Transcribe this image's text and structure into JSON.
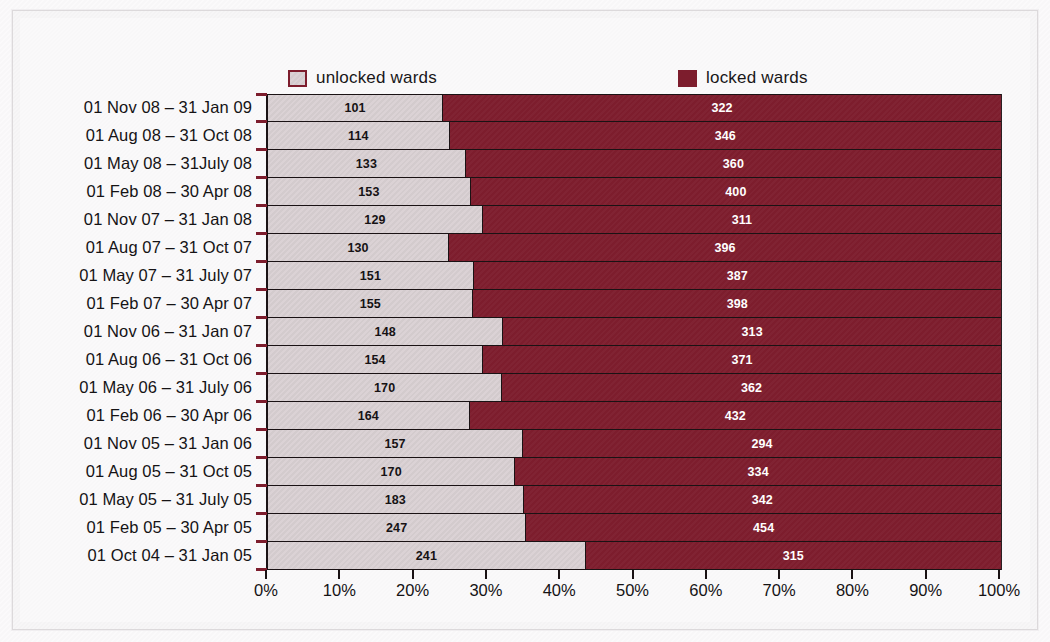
{
  "chart_data": {
    "type": "bar",
    "subtype": "horizontal-stacked-100-percent",
    "title": "",
    "xlabel": "",
    "ylabel": "",
    "xlim": [
      0,
      100
    ],
    "x_tick_labels": [
      "0%",
      "10%",
      "20%",
      "30%",
      "40%",
      "50%",
      "60%",
      "70%",
      "80%",
      "90%",
      "100%"
    ],
    "x_tick_values": [
      0,
      10,
      20,
      30,
      40,
      50,
      60,
      70,
      80,
      90,
      100
    ],
    "grid": false,
    "legend_position": "top",
    "colors": {
      "unlocked": "#dbd2d5",
      "locked": "#7d1d2d",
      "outline": "#1a1214",
      "text": "#151315",
      "background": "#faf9fa"
    },
    "series": [
      {
        "name": "unlocked wards",
        "color": "#dbd2d5",
        "values": [
          101,
          114,
          133,
          153,
          129,
          130,
          151,
          155,
          148,
          154,
          170,
          164,
          157,
          170,
          183,
          247,
          241
        ]
      },
      {
        "name": "locked wards",
        "color": "#7d1d2d",
        "values": [
          322,
          346,
          360,
          400,
          311,
          396,
          387,
          398,
          313,
          371,
          362,
          432,
          294,
          334,
          342,
          454,
          315
        ]
      }
    ],
    "categories": [
      "01 Nov 08 – 31 Jan 09",
      "01 Aug 08 – 31 Oct 08",
      "01 May 08 – 31July 08",
      "01 Feb 08 – 30 Apr 08",
      "01 Nov 07 – 31 Jan 08",
      "01 Aug 07 – 31 Oct 07",
      "01 May 07 – 31 July 07",
      "01 Feb 07 – 30 Apr 07",
      "01 Nov 06 – 31 Jan 07",
      "01 Aug 06 – 31 Oct 06",
      "01 May 06 – 31 July 06",
      "01 Feb 06 – 30 Apr 06",
      "01 Nov 05 – 31 Jan 06",
      "01 Aug 05 – 31 Oct 05",
      "01 May 05 – 31 July 05",
      "01 Feb 05 – 30 Apr 05",
      "01 Oct 04 – 31 Jan 05"
    ]
  },
  "legend": {
    "entries": [
      {
        "label": "unlocked wards",
        "swatch": "unlocked"
      },
      {
        "label": "locked wards",
        "swatch": "locked"
      }
    ]
  }
}
